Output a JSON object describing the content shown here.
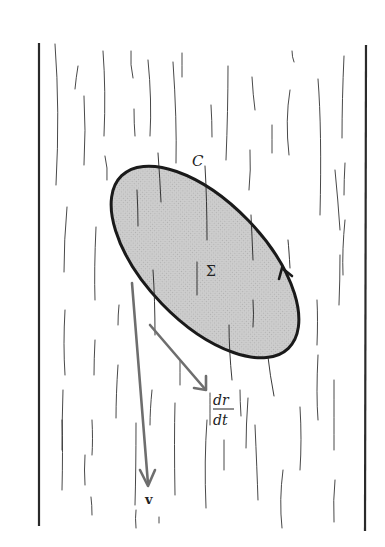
{
  "figure": {
    "colors": {
      "background": "#ffffff",
      "frame": "#2a2a2a",
      "streamline": "#333333",
      "surface_fill": "#c8c8c8",
      "surface_outline": "#1a1a1a",
      "vector": "#6e6e6e",
      "text": "#222222"
    },
    "labels": {
      "curve": "C",
      "surface": "Σ",
      "tangent_numerator": "dr",
      "tangent_denominator": "dt",
      "velocity": "v"
    },
    "frame": {
      "left_wall": {
        "x": 39,
        "y1": 43,
        "y2": 526
      },
      "right_wall": {
        "x": 365,
        "y1": 45,
        "y2": 531
      }
    },
    "surface": {
      "cx": 205,
      "cy": 262,
      "rx": 118,
      "ry": 60,
      "rotation_deg": 46
    },
    "vectors": {
      "velocity": {
        "x1": 131,
        "y1": 283,
        "x2": 148,
        "y2": 485
      },
      "tangent": {
        "x1": 150,
        "y1": 325,
        "x2": 205,
        "y2": 388
      }
    }
  }
}
